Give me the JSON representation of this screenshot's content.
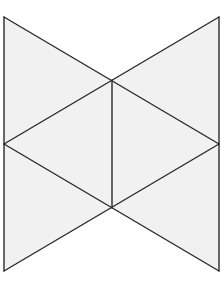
{
  "figure": {
    "colors": {
      "background": "#ffffff",
      "fill": "#f1f1f1",
      "stroke": "#2a2a2a"
    },
    "vertices": {
      "top_left": [
        4,
        17
      ],
      "top_right": [
        219,
        17
      ],
      "top_center": [
        112,
        80
      ],
      "mid_left": [
        4,
        144
      ],
      "mid_right": [
        219,
        144
      ],
      "bottom_center": [
        112,
        208
      ],
      "bottom_left": [
        4,
        271
      ],
      "bottom_right": [
        219,
        271
      ]
    }
  }
}
